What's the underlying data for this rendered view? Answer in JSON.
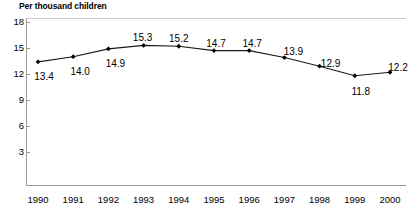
{
  "chart_data": {
    "type": "line",
    "title": "Per thousand children",
    "xlabel": "",
    "ylabel": "",
    "categories": [
      "1990",
      "1991",
      "1992",
      "1993",
      "1994",
      "1995",
      "1996",
      "1997",
      "1998",
      "1999",
      "2000"
    ],
    "values": [
      13.4,
      14.0,
      14.9,
      15.3,
      15.2,
      14.7,
      14.7,
      13.9,
      12.9,
      11.8,
      12.2
    ],
    "point_labels": [
      "13.4",
      "14.0",
      "14.9",
      "15.3",
      "15.2",
      "14.7",
      "14.7",
      "13.9",
      "12.9",
      "11.8",
      "12.2"
    ],
    "label_positions": [
      "below",
      "below",
      "below",
      "above",
      "above",
      "above",
      "above",
      "above",
      "above",
      "below",
      "above"
    ],
    "yticks": [
      18,
      15,
      12,
      9,
      6,
      3
    ],
    "ytick_labels": [
      "18",
      "15",
      "12",
      "9",
      "6",
      "3"
    ],
    "ylim": [
      0,
      18.5
    ],
    "grid": false,
    "legend": false,
    "marker": "diamond",
    "line_color": "#1a1a1a",
    "marker_color": "#000000",
    "axis_color": "#9a9a9a"
  }
}
